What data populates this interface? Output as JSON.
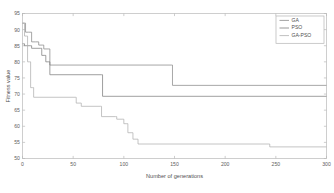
{
  "chart_data": {
    "type": "line",
    "title": "",
    "xlabel": "Number of generations",
    "ylabel": "Fitness value",
    "xlim": [
      0,
      300
    ],
    "ylim": [
      50,
      95
    ],
    "xticks": [
      0,
      50,
      100,
      150,
      200,
      250,
      300
    ],
    "yticks": [
      50,
      55,
      60,
      65,
      70,
      75,
      80,
      85,
      90,
      95
    ],
    "grid": false,
    "legend_position": "top-right",
    "step_type": "post",
    "series": [
      {
        "name": "GA",
        "color": "#8a8a8a",
        "x": [
          0,
          2,
          3,
          6,
          9,
          13,
          16,
          20,
          21,
          26,
          27,
          147,
          148,
          300
        ],
        "y": [
          92.0,
          92.0,
          89.2,
          89.2,
          86.2,
          86.2,
          85.2,
          85.2,
          84.0,
          84.0,
          79.0,
          79.0,
          72.7,
          72.7
        ]
      },
      {
        "name": "PSO",
        "color": "#7f7f7f",
        "x": [
          0,
          1,
          2,
          8,
          9,
          18,
          19,
          22,
          23,
          26,
          27,
          78,
          79,
          300
        ],
        "y": [
          85.6,
          85.6,
          85.0,
          85.0,
          84.2,
          84.2,
          82.0,
          82.0,
          80.0,
          80.0,
          76.0,
          76.0,
          69.3,
          69.3
        ]
      },
      {
        "name": "GA-PSO",
        "color": "#b0b0b0",
        "x": [
          0,
          1,
          2,
          4,
          5,
          7,
          8,
          10,
          11,
          52,
          53,
          57,
          58,
          77,
          78,
          92,
          93,
          99,
          100,
          103,
          104,
          108,
          109,
          113,
          114,
          243,
          244,
          300
        ],
        "y": [
          92.0,
          92.0,
          88.0,
          88.0,
          80.0,
          80.0,
          72.0,
          72.0,
          69.0,
          69.0,
          67.2,
          67.2,
          66.2,
          66.2,
          63.0,
          63.0,
          62.2,
          62.2,
          60.8,
          60.8,
          58.0,
          58.0,
          56.0,
          56.0,
          54.5,
          54.5,
          53.6,
          53.6
        ]
      }
    ]
  },
  "legend": {
    "entries": [
      {
        "label": "GA"
      },
      {
        "label": "PSO"
      },
      {
        "label": "GA-PSO"
      }
    ]
  },
  "axes": {
    "xlabel": "Number of generations",
    "ylabel": "Fitness value"
  }
}
